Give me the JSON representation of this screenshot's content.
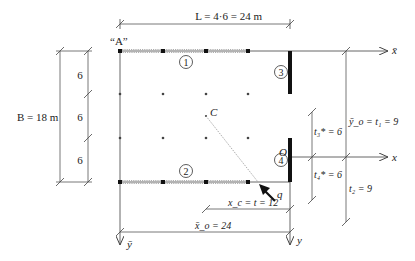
{
  "diagram": {
    "dimensions": {
      "L_label": "L = 4·6 = 24 m",
      "B_label": "B = 18 m",
      "left_segments": [
        "6",
        "6",
        "6"
      ],
      "xc_label": "x_c = t = 12",
      "xo_bar_label": "x̄_o = 24",
      "t3_label": "t₃* = 6",
      "t4_label": "t₄* = 6",
      "yo_label": "ȳ_o = t₁ = 9",
      "t2_label": "t₂ = 9"
    },
    "points": {
      "A": "“A”",
      "C": "C",
      "O": "O"
    },
    "axes": {
      "x_bar": "x̄",
      "x": "x",
      "y_bar": "ȳ",
      "y": "y"
    },
    "walls": [
      "1",
      "2",
      "3",
      "4"
    ],
    "load": "q",
    "colors": {
      "line": "#555555",
      "thick": "#111111",
      "dot": "#444444"
    }
  }
}
